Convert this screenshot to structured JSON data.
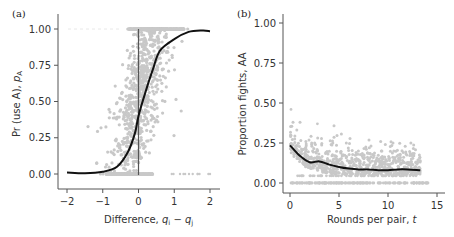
{
  "chart_data": [
    {
      "type": "scatter",
      "panel_label": "(a)",
      "title": "",
      "xlabel": "Difference, q_i − q_j",
      "xlabel_main": "Difference, ",
      "xlabel_q1": "q",
      "xlabel_sub1": "i",
      "xlabel_minus": " − ",
      "xlabel_q2": "q",
      "xlabel_sub2": "j",
      "ylabel": "Pr (use A), p_A",
      "ylabel_main": "Pr (use A), ",
      "ylabel_p": "p",
      "ylabel_sub": "A",
      "xlim": [
        -2,
        2
      ],
      "ylim": [
        0,
        1
      ],
      "xticks": [
        "−2",
        "−1",
        "0",
        "1",
        "2"
      ],
      "xtick_values": [
        -2,
        -1,
        0,
        1,
        2
      ],
      "yticks": [
        "0.00",
        "0.25",
        "0.50",
        "0.75",
        "1.00"
      ],
      "ytick_values": [
        0,
        0.25,
        0.5,
        0.75,
        1.0
      ],
      "grid": false,
      "reference_line_x": 0,
      "scatter_color": "#c8c8c8",
      "curve_color": "#111111",
      "fitted_curve": {
        "x": [
          -2,
          -1.5,
          -1,
          -0.6,
          -0.3,
          -0.1,
          0,
          0.2,
          0.4,
          0.6,
          1.0,
          1.4,
          1.8,
          2.0
        ],
        "y": [
          0.01,
          0.005,
          0.015,
          0.05,
          0.15,
          0.28,
          0.4,
          0.57,
          0.72,
          0.85,
          0.93,
          0.98,
          0.99,
          0.985
        ]
      },
      "scatter_description": "Dense grey points across 0–1, concentrated near x = 0; points along y = 0 and y = 1 bands"
    },
    {
      "type": "scatter",
      "panel_label": "(b)",
      "title": "",
      "xlabel": "Rounds per pair, t",
      "xlabel_main": "Rounds per pair, ",
      "xlabel_var": "t",
      "ylabel": "Proportion fights, AA",
      "xlim": [
        0,
        15
      ],
      "ylim": [
        0,
        1
      ],
      "xticks": [
        "0",
        "5",
        "10",
        "15"
      ],
      "xtick_values": [
        0,
        5,
        10,
        15
      ],
      "yticks": [
        "0.00",
        "0.25",
        "0.50",
        "0.75",
        "1.00"
      ],
      "ytick_values": [
        0,
        0.25,
        0.5,
        0.75,
        1.0
      ],
      "grid": false,
      "scatter_color": "#c8c8c8",
      "curve_color": "#111111",
      "fitted_curve": {
        "x": [
          0,
          1,
          2,
          3,
          4,
          5,
          6,
          7,
          8,
          9,
          10,
          11,
          12,
          13.3
        ],
        "y": [
          0.235,
          0.17,
          0.13,
          0.135,
          0.115,
          0.1,
          0.09,
          0.085,
          0.085,
          0.08,
          0.08,
          0.085,
          0.085,
          0.08
        ]
      },
      "scatter_description": "Grey points mostly between 0 and 0.35, with a band at 0.00 across t = 0–13"
    }
  ]
}
